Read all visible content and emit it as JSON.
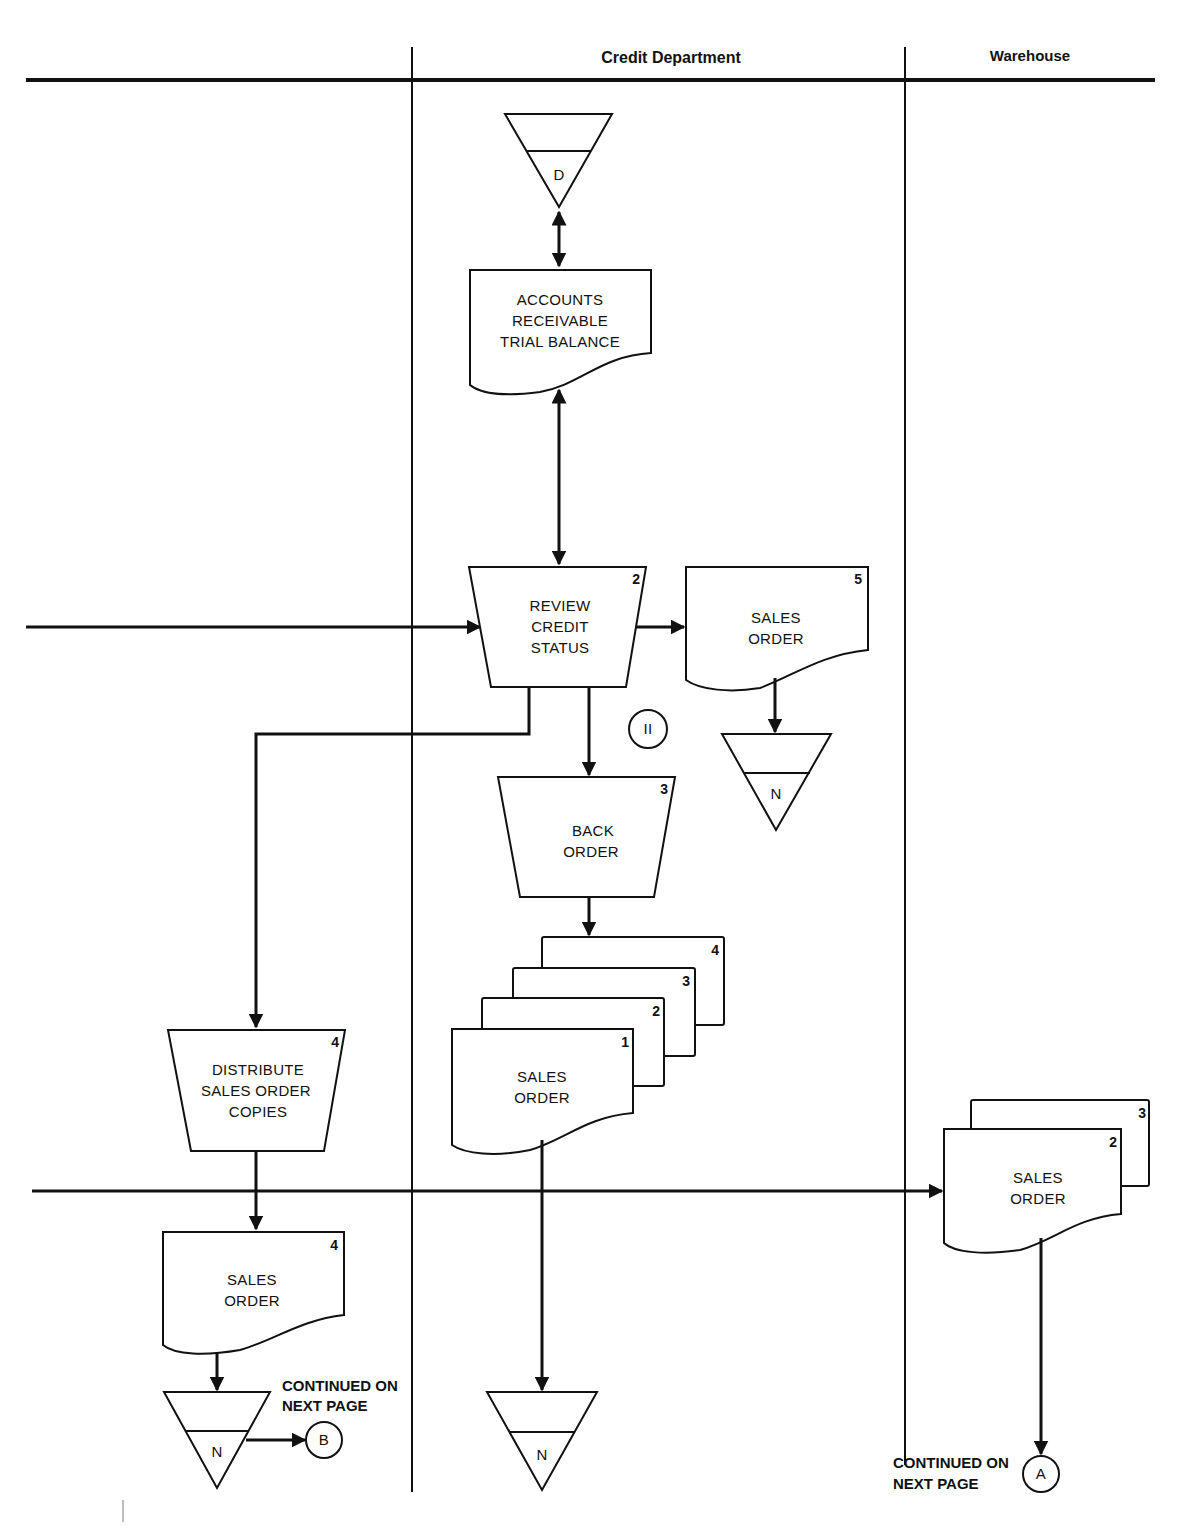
{
  "lanes": {
    "col1": "",
    "col2": "Credit Department",
    "col3": "Warehouse"
  },
  "nodes": {
    "file_d": {
      "label": "D",
      "type": "offline-file"
    },
    "ar_trial_balance": {
      "lines": [
        "ACCOUNTS",
        "RECEIVABLE",
        "TRIAL BALANCE"
      ],
      "type": "document"
    },
    "review_credit": {
      "lines": [
        "REVIEW",
        "CREDIT",
        "STATUS"
      ],
      "number": "2",
      "type": "manual-operation"
    },
    "sales_order_5": {
      "lines": [
        "SALES",
        "ORDER"
      ],
      "number": "5",
      "type": "document"
    },
    "file_n_1": {
      "label": "N",
      "type": "offline-file"
    },
    "annotation_11": {
      "label": "II",
      "type": "annotation-circle"
    },
    "back_order": {
      "lines": [
        "BACK",
        "ORDER"
      ],
      "number": "3",
      "type": "manual-operation"
    },
    "sales_order_stack": {
      "lines": [
        "SALES",
        "ORDER"
      ],
      "copies": [
        "1",
        "2",
        "3",
        "4"
      ],
      "type": "multi-document"
    },
    "distribute": {
      "lines": [
        "DISTRIBUTE",
        "SALES ORDER",
        "COPIES"
      ],
      "number": "4",
      "type": "manual-operation"
    },
    "sales_order_4": {
      "lines": [
        "SALES",
        "ORDER"
      ],
      "number": "4",
      "type": "document"
    },
    "file_n_2": {
      "label": "N",
      "type": "offline-file"
    },
    "file_n_3": {
      "label": "N",
      "type": "offline-file"
    },
    "sales_order_wh": {
      "lines": [
        "SALES",
        "ORDER"
      ],
      "copies": [
        "2",
        "3"
      ],
      "type": "multi-document"
    },
    "connector_b": {
      "label": "B",
      "note": [
        "CONTINUED ON",
        "NEXT PAGE"
      ]
    },
    "connector_a": {
      "label": "A",
      "note": [
        "CONTINUED ON",
        "NEXT PAGE"
      ]
    }
  }
}
